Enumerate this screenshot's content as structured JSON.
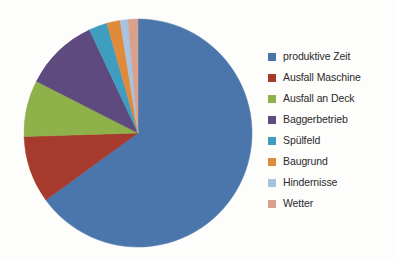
{
  "chart_data": {
    "type": "pie",
    "title": "",
    "legend_position": "right",
    "grid": false,
    "categories": [
      "produktive Zeit",
      "Ausfall Maschine",
      "Ausfall an Deck",
      "Baggerbetrieb",
      "Spülfeld",
      "Baugrund",
      "Hindernisse",
      "Wetter"
    ],
    "values": [
      65.0,
      9.5,
      8.0,
      10.5,
      2.6,
      1.9,
      1.1,
      1.4
    ],
    "unit": "%",
    "colors": [
      "#4a76ab",
      "#a53a2d",
      "#8fb14a",
      "#5e4a7e",
      "#3f9ec0",
      "#e08a3c",
      "#a7c3e0",
      "#d9a08b"
    ],
    "start_angle_deg": 0,
    "direction": "clockwise",
    "center": {
      "x": 138,
      "y": 133
    },
    "radius": 114
  },
  "legend": {
    "items": [
      {
        "label": "produktive Zeit",
        "color": "#4a76ab"
      },
      {
        "label": "Ausfall Maschine",
        "color": "#a53a2d"
      },
      {
        "label": "Ausfall an Deck",
        "color": "#8fb14a"
      },
      {
        "label": "Baggerbetrieb",
        "color": "#5e4a7e"
      },
      {
        "label": "Spülfeld",
        "color": "#3f9ec0"
      },
      {
        "label": "Baugrund",
        "color": "#e08a3c"
      },
      {
        "label": "Hindernisse",
        "color": "#a7c3e0"
      },
      {
        "label": "Wetter",
        "color": "#d9a08b"
      }
    ]
  }
}
